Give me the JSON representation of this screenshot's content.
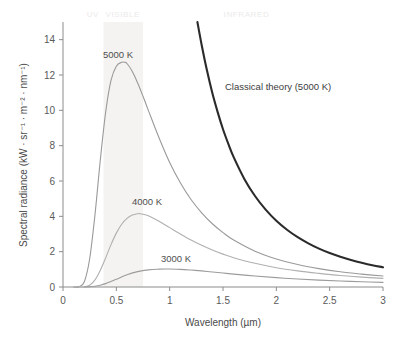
{
  "chart_data": {
    "type": "line",
    "title": "",
    "xlabel": "Wavelength (µm)",
    "ylabel": "Spectral radiance (kW · sr⁻¹ · m⁻² · nm⁻¹)",
    "xlim": [
      0,
      3
    ],
    "ylim": [
      0,
      15
    ],
    "xticks": [
      "0",
      "0.5",
      "1",
      "1.5",
      "2",
      "2.5",
      "3"
    ],
    "xtick_values": [
      0,
      0.5,
      1,
      1.5,
      2,
      2.5,
      3
    ],
    "yticks": [
      "0",
      "2",
      "4",
      "6",
      "8",
      "10",
      "12",
      "14"
    ],
    "ytick_values": [
      0,
      2,
      4,
      6,
      8,
      10,
      12,
      14
    ],
    "grid": false,
    "legend_position": "inline-annotations",
    "series": [
      {
        "name": "5000 K",
        "label": "5000 K",
        "color": "#9a9a9a",
        "peak_wavelength_um": 0.58,
        "peak_radiance": 12.7,
        "x": [
          0.1,
          0.15,
          0.2,
          0.25,
          0.3,
          0.35,
          0.4,
          0.45,
          0.5,
          0.55,
          0.58,
          0.6,
          0.65,
          0.7,
          0.75,
          0.8,
          0.9,
          1.0,
          1.1,
          1.2,
          1.3,
          1.4,
          1.5,
          1.6,
          1.8,
          2.0,
          2.2,
          2.4,
          2.6,
          2.8,
          3.0
        ],
        "y": [
          0.0,
          0.02,
          0.3,
          1.6,
          4.1,
          7.2,
          9.9,
          11.7,
          12.5,
          12.72,
          12.72,
          12.65,
          12.2,
          11.55,
          10.8,
          10.0,
          8.45,
          7.05,
          5.9,
          4.95,
          4.2,
          3.58,
          3.08,
          2.66,
          2.03,
          1.59,
          1.27,
          1.04,
          0.86,
          0.73,
          0.62
        ]
      },
      {
        "name": "4000 K",
        "label": "4000 K",
        "color": "#b0b0b0",
        "peak_wavelength_um": 0.72,
        "peak_radiance": 4.15,
        "x": [
          0.15,
          0.2,
          0.25,
          0.3,
          0.35,
          0.4,
          0.45,
          0.5,
          0.55,
          0.6,
          0.65,
          0.7,
          0.72,
          0.75,
          0.8,
          0.9,
          1.0,
          1.1,
          1.2,
          1.3,
          1.4,
          1.5,
          1.6,
          1.8,
          2.0,
          2.2,
          2.4,
          2.6,
          2.8,
          3.0
        ],
        "y": [
          0.0,
          0.01,
          0.1,
          0.4,
          0.95,
          1.65,
          2.4,
          3.05,
          3.55,
          3.88,
          4.07,
          4.15,
          4.15,
          4.12,
          4.03,
          3.72,
          3.36,
          3.0,
          2.66,
          2.36,
          2.09,
          1.86,
          1.66,
          1.34,
          1.09,
          0.91,
          0.77,
          0.65,
          0.56,
          0.49
        ]
      },
      {
        "name": "3000 K",
        "label": "3000 K",
        "color": "#9c9c9c",
        "peak_wavelength_um": 0.97,
        "peak_radiance": 1.02,
        "x": [
          0.2,
          0.25,
          0.3,
          0.35,
          0.4,
          0.45,
          0.5,
          0.6,
          0.7,
          0.8,
          0.9,
          0.97,
          1.0,
          1.1,
          1.2,
          1.3,
          1.4,
          1.5,
          1.6,
          1.8,
          2.0,
          2.2,
          2.4,
          2.6,
          2.8,
          3.0
        ],
        "y": [
          0.0,
          0.01,
          0.04,
          0.1,
          0.19,
          0.31,
          0.44,
          0.69,
          0.87,
          0.97,
          1.01,
          1.02,
          1.02,
          1.0,
          0.96,
          0.91,
          0.85,
          0.79,
          0.73,
          0.62,
          0.53,
          0.45,
          0.39,
          0.34,
          0.3,
          0.26
        ]
      },
      {
        "name": "Classical theory (5000 K)",
        "label": "Classical theory (5000 K)",
        "color": "#2b2b2b",
        "note": "Rayleigh-Jeans law, diverges at short wavelengths (ultraviolet catastrophe)",
        "x": [
          1.26,
          1.3,
          1.35,
          1.4,
          1.45,
          1.5,
          1.55,
          1.6,
          1.7,
          1.8,
          1.9,
          2.0,
          2.1,
          2.2,
          2.3,
          2.4,
          2.5,
          2.6,
          2.7,
          2.8,
          2.9,
          3.0
        ],
        "y": [
          15.0,
          13.7,
          12.25,
          10.98,
          9.9,
          8.93,
          8.1,
          7.35,
          6.12,
          5.15,
          4.38,
          3.75,
          3.24,
          2.82,
          2.47,
          2.17,
          1.92,
          1.71,
          1.53,
          1.37,
          1.23,
          1.12
        ]
      }
    ],
    "annotations": [
      {
        "name": "uv-band-label",
        "text": "UV",
        "x_um": 0.28,
        "position": "top"
      },
      {
        "name": "visible-band-label",
        "text": "VISIBLE",
        "x_um": 0.56,
        "position": "top"
      },
      {
        "name": "infrared-band-label",
        "text": "INFRARED",
        "x_um": 1.72,
        "position": "top"
      }
    ],
    "shaded_bands": [
      {
        "name": "visible-spectrum-band",
        "from_um": 0.38,
        "to_um": 0.75,
        "color": "#f4f3f1"
      }
    ]
  },
  "axes": {
    "x_title": "Wavelength (µm)",
    "y_title": "Spectral radiance (kW · sr⁻¹ · m⁻² · nm⁻¹)"
  },
  "labels": {
    "t5000": "5000 K",
    "t4000": "4000 K",
    "t3000": "3000 K",
    "classical": "Classical theory (5000 K)",
    "uv": "UV",
    "visible": "VISIBLE",
    "infrared": "INFRARED"
  }
}
